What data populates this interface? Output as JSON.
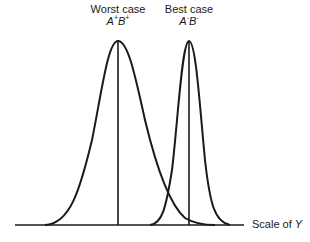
{
  "diagram": {
    "title": "",
    "curves": [
      {
        "name": "worst-case",
        "label": "Worst case",
        "formula_a": "A",
        "sign_a": "+",
        "formula_b": "B",
        "sign_b": "+",
        "peak_x": 118,
        "spread": "wide"
      },
      {
        "name": "best-case",
        "label": "Best case",
        "formula_a": "A",
        "sign_a": "-",
        "formula_b": "B",
        "sign_b": "-",
        "peak_x": 189,
        "spread": "narrow"
      }
    ],
    "axis": {
      "label_prefix": "Scale of ",
      "label_var": "Y"
    }
  }
}
